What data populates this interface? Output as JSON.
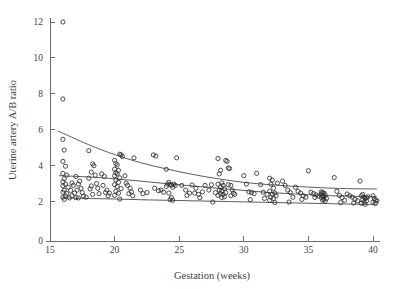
{
  "chart_data": {
    "type": "scatter",
    "title": "",
    "xlabel": "Gestation (weeks)",
    "ylabel": "Uterine artery A/B ratio",
    "xlim": [
      14.2,
      41.2
    ],
    "ylim": [
      0,
      12.6
    ],
    "xticks": [
      15,
      20,
      25,
      30,
      35,
      40
    ],
    "yticks": [
      0,
      2,
      4,
      6,
      8,
      10,
      12
    ],
    "xtick_labels": [
      "15",
      "20",
      "25",
      "30",
      "35",
      "40"
    ],
    "ytick_labels": [
      "0",
      "2",
      "4",
      "6",
      "8",
      "10",
      "12"
    ],
    "grid": false,
    "legend": "none",
    "marker": "open-circle",
    "points": [
      [
        16.0,
        12.0
      ],
      [
        16.0,
        7.7
      ],
      [
        16.0,
        5.45
      ],
      [
        16.1,
        4.85
      ],
      [
        16.0,
        4.22
      ],
      [
        16.2,
        3.95
      ],
      [
        16.0,
        3.55
      ],
      [
        16.3,
        3.45
      ],
      [
        16.1,
        3.25
      ],
      [
        16.0,
        3.08
      ],
      [
        16.2,
        2.95
      ],
      [
        16.0,
        2.85
      ],
      [
        16.4,
        2.78
      ],
      [
        16.1,
        2.62
      ],
      [
        16.0,
        2.5
      ],
      [
        16.3,
        2.42
      ],
      [
        16.2,
        2.3
      ],
      [
        16.0,
        2.22
      ],
      [
        16.5,
        2.18
      ],
      [
        16.1,
        2.1
      ],
      [
        16.7,
        3.02
      ],
      [
        16.8,
        2.88
      ],
      [
        16.6,
        2.6
      ],
      [
        16.9,
        2.45
      ],
      [
        16.7,
        2.3
      ],
      [
        17.0,
        2.2
      ],
      [
        17.1,
        2.62
      ],
      [
        17.2,
        2.95
      ],
      [
        17.3,
        3.12
      ],
      [
        17.0,
        3.38
      ],
      [
        17.4,
        2.72
      ],
      [
        17.5,
        2.48
      ],
      [
        17.6,
        2.28
      ],
      [
        17.8,
        2.22
      ],
      [
        17.2,
        2.18
      ],
      [
        18.0,
        4.82
      ],
      [
        18.3,
        4.08
      ],
      [
        18.4,
        3.98
      ],
      [
        18.2,
        3.62
      ],
      [
        18.5,
        3.45
      ],
      [
        18.0,
        3.28
      ],
      [
        18.6,
        2.98
      ],
      [
        18.2,
        2.85
      ],
      [
        18.7,
        2.72
      ],
      [
        18.1,
        2.68
      ],
      [
        18.8,
        2.42
      ],
      [
        18.3,
        2.38
      ],
      [
        19.0,
        3.52
      ],
      [
        19.2,
        3.38
      ],
      [
        19.1,
        2.88
      ],
      [
        19.4,
        2.62
      ],
      [
        19.3,
        2.48
      ],
      [
        19.6,
        2.45
      ],
      [
        19.5,
        2.3
      ],
      [
        20.0,
        4.28
      ],
      [
        20.1,
        4.1
      ],
      [
        20.2,
        4.02
      ],
      [
        20.0,
        3.78
      ],
      [
        20.3,
        3.72
      ],
      [
        20.1,
        3.6
      ],
      [
        20.2,
        3.52
      ],
      [
        20.0,
        3.42
      ],
      [
        20.4,
        3.3
      ],
      [
        20.1,
        3.18
      ],
      [
        20.3,
        3.05
      ],
      [
        20.0,
        2.92
      ],
      [
        20.2,
        2.82
      ],
      [
        20.5,
        2.7
      ],
      [
        20.1,
        2.55
      ],
      [
        20.3,
        2.45
      ],
      [
        20.0,
        2.32
      ],
      [
        20.4,
        2.12
      ],
      [
        20.4,
        4.62
      ],
      [
        20.5,
        4.58
      ],
      [
        20.6,
        4.5
      ],
      [
        20.8,
        3.42
      ],
      [
        20.9,
        3.0
      ],
      [
        21.0,
        2.88
      ],
      [
        21.2,
        2.72
      ],
      [
        21.3,
        2.52
      ],
      [
        21.1,
        2.42
      ],
      [
        21.5,
        4.42
      ],
      [
        21.4,
        2.3
      ],
      [
        22.0,
        2.62
      ],
      [
        22.2,
        2.42
      ],
      [
        22.5,
        2.48
      ],
      [
        23.0,
        4.58
      ],
      [
        23.2,
        4.52
      ],
      [
        23.1,
        2.72
      ],
      [
        23.4,
        2.58
      ],
      [
        23.6,
        2.62
      ],
      [
        23.8,
        2.5
      ],
      [
        24.0,
        3.78
      ],
      [
        24.2,
        3.05
      ],
      [
        24.1,
        2.95
      ],
      [
        24.3,
        2.92
      ],
      [
        24.4,
        2.9
      ],
      [
        24.0,
        2.82
      ],
      [
        24.5,
        2.78
      ],
      [
        24.6,
        2.95
      ],
      [
        24.2,
        2.45
      ],
      [
        24.4,
        2.2
      ],
      [
        24.3,
        2.08
      ],
      [
        24.5,
        2.05
      ],
      [
        24.8,
        4.42
      ],
      [
        24.7,
        2.88
      ],
      [
        25.2,
        2.88
      ],
      [
        25.5,
        2.62
      ],
      [
        25.8,
        2.45
      ],
      [
        25.6,
        2.32
      ],
      [
        26.0,
        2.9
      ],
      [
        26.3,
        2.72
      ],
      [
        26.2,
        2.45
      ],
      [
        26.5,
        2.38
      ],
      [
        26.8,
        2.52
      ],
      [
        26.6,
        2.2
      ],
      [
        27.0,
        2.88
      ],
      [
        27.3,
        2.62
      ],
      [
        27.5,
        2.92
      ],
      [
        27.8,
        2.48
      ],
      [
        27.6,
        1.95
      ],
      [
        28.0,
        4.38
      ],
      [
        28.2,
        3.72
      ],
      [
        28.1,
        3.52
      ],
      [
        28.3,
        3.02
      ],
      [
        28.0,
        2.95
      ],
      [
        28.4,
        2.88
      ],
      [
        28.2,
        2.78
      ],
      [
        28.5,
        2.7
      ],
      [
        28.1,
        2.62
      ],
      [
        28.3,
        2.55
      ],
      [
        28.6,
        2.48
      ],
      [
        28.2,
        2.42
      ],
      [
        28.4,
        2.38
      ],
      [
        28.0,
        2.32
      ],
      [
        28.5,
        2.25
      ],
      [
        28.3,
        2.2
      ],
      [
        28.6,
        4.28
      ],
      [
        28.7,
        4.22
      ],
      [
        28.8,
        3.85
      ],
      [
        28.9,
        3.82
      ],
      [
        28.8,
        2.92
      ],
      [
        29.0,
        2.88
      ],
      [
        29.1,
        2.62
      ],
      [
        29.2,
        2.45
      ],
      [
        29.3,
        2.38
      ],
      [
        29.0,
        2.3
      ],
      [
        30.0,
        3.42
      ],
      [
        30.2,
        2.95
      ],
      [
        30.4,
        2.52
      ],
      [
        30.6,
        2.48
      ],
      [
        30.8,
        2.42
      ],
      [
        30.5,
        2.08
      ],
      [
        31.0,
        3.55
      ],
      [
        31.3,
        2.92
      ],
      [
        31.5,
        2.5
      ],
      [
        31.8,
        2.38
      ],
      [
        31.6,
        2.15
      ],
      [
        32.0,
        3.28
      ],
      [
        32.2,
        3.18
      ],
      [
        32.1,
        2.95
      ],
      [
        32.3,
        2.72
      ],
      [
        32.0,
        2.55
      ],
      [
        32.4,
        2.45
      ],
      [
        32.2,
        2.38
      ],
      [
        32.5,
        2.3
      ],
      [
        32.1,
        2.22
      ],
      [
        32.3,
        2.15
      ],
      [
        32.0,
        2.05
      ],
      [
        32.4,
        1.92
      ],
      [
        32.6,
        3.0
      ],
      [
        33.0,
        3.12
      ],
      [
        33.2,
        2.88
      ],
      [
        33.4,
        2.62
      ],
      [
        33.6,
        2.48
      ],
      [
        33.8,
        2.22
      ],
      [
        33.5,
        1.95
      ],
      [
        34.0,
        2.78
      ],
      [
        34.2,
        2.55
      ],
      [
        34.4,
        2.45
      ],
      [
        34.6,
        2.3
      ],
      [
        34.8,
        2.22
      ],
      [
        34.5,
        2.1
      ],
      [
        35.0,
        3.7
      ],
      [
        35.2,
        2.5
      ],
      [
        35.4,
        2.42
      ],
      [
        35.6,
        2.35
      ],
      [
        35.8,
        2.28
      ],
      [
        35.5,
        2.2
      ],
      [
        36.0,
        2.52
      ],
      [
        36.1,
        2.48
      ],
      [
        36.2,
        2.45
      ],
      [
        36.0,
        2.4
      ],
      [
        36.3,
        2.35
      ],
      [
        36.1,
        2.3
      ],
      [
        36.2,
        2.25
      ],
      [
        36.0,
        2.2
      ],
      [
        36.4,
        2.15
      ],
      [
        36.2,
        2.1
      ],
      [
        36.1,
        2.05
      ],
      [
        36.3,
        2.0
      ],
      [
        37.0,
        3.32
      ],
      [
        37.2,
        2.55
      ],
      [
        37.4,
        2.32
      ],
      [
        37.6,
        2.2
      ],
      [
        37.8,
        2.05
      ],
      [
        37.5,
        1.92
      ],
      [
        38.0,
        2.4
      ],
      [
        38.2,
        2.3
      ],
      [
        38.4,
        2.22
      ],
      [
        38.6,
        2.1
      ],
      [
        38.8,
        2.02
      ],
      [
        38.5,
        1.9
      ],
      [
        39.0,
        3.12
      ],
      [
        39.2,
        2.38
      ],
      [
        39.1,
        2.3
      ],
      [
        39.3,
        2.22
      ],
      [
        39.4,
        2.15
      ],
      [
        39.2,
        2.08
      ],
      [
        39.5,
        2.02
      ],
      [
        39.3,
        1.95
      ],
      [
        39.1,
        1.88
      ],
      [
        39.4,
        1.82
      ],
      [
        39.6,
        2.25
      ],
      [
        39.5,
        2.18
      ],
      [
        40.0,
        2.3
      ],
      [
        40.1,
        2.12
      ],
      [
        40.2,
        2.05
      ],
      [
        40.0,
        1.95
      ],
      [
        40.3,
        2.02
      ],
      [
        40.2,
        1.88
      ]
    ],
    "curves": [
      {
        "name": "upper-95th-centile",
        "points": [
          [
            15.6,
            5.92
          ],
          [
            18.0,
            5.15
          ],
          [
            20.0,
            4.6
          ],
          [
            22.0,
            4.15
          ],
          [
            24.0,
            3.8
          ],
          [
            26.0,
            3.5
          ],
          [
            28.0,
            3.25
          ],
          [
            30.0,
            3.05
          ],
          [
            32.0,
            2.92
          ],
          [
            34.0,
            2.82
          ],
          [
            36.0,
            2.75
          ],
          [
            38.0,
            2.7
          ],
          [
            40.3,
            2.68
          ]
        ]
      },
      {
        "name": "median-centile",
        "points": [
          [
            15.7,
            3.42
          ],
          [
            18.0,
            3.35
          ],
          [
            20.0,
            3.25
          ],
          [
            22.0,
            3.12
          ],
          [
            24.0,
            2.98
          ],
          [
            26.0,
            2.85
          ],
          [
            28.0,
            2.72
          ],
          [
            30.0,
            2.6
          ],
          [
            32.0,
            2.48
          ],
          [
            34.0,
            2.4
          ],
          [
            36.0,
            2.32
          ],
          [
            38.0,
            2.28
          ],
          [
            40.3,
            2.25
          ]
        ]
      },
      {
        "name": "lower-5th-centile",
        "points": [
          [
            15.9,
            2.18
          ],
          [
            18.0,
            2.15
          ],
          [
            20.0,
            2.12
          ],
          [
            22.0,
            2.08
          ],
          [
            24.0,
            2.05
          ],
          [
            26.0,
            2.02
          ],
          [
            28.0,
            1.99
          ],
          [
            30.0,
            1.96
          ],
          [
            32.0,
            1.93
          ],
          [
            34.0,
            1.9
          ],
          [
            36.0,
            1.87
          ],
          [
            38.0,
            1.84
          ],
          [
            40.3,
            1.8
          ]
        ]
      }
    ],
    "colors": {
      "axis": "#6d6d6d",
      "marker_stroke": "#2e2e2e",
      "curve": "#4a4a4a",
      "text": "#3f3f3f",
      "background": "#ffffff"
    }
  }
}
